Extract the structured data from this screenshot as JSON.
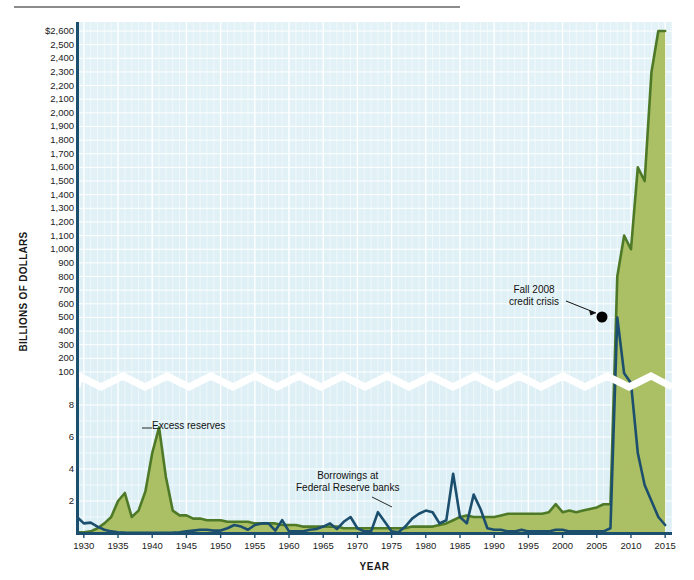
{
  "figure": {
    "y_axis_title": "BILLIONS OF DOLLARS",
    "x_axis_title": "YEAR"
  },
  "annotations": {
    "excess": "Excess reserves",
    "borrow_line1": "Borrowings at",
    "borrow_line2": "Federal Reserve banks",
    "crisis_line1": "Fall 2008",
    "crisis_line2": "credit crisis"
  },
  "colors": {
    "plot_background": "#dff0f5",
    "gridline": "#ffffff",
    "axis": "#1c4f6e",
    "series_reserves_line": "#4e7a28",
    "series_reserves_fill": "#a8bc5c",
    "series_borrowings_line": "#1c4f6e",
    "marker": "#000000",
    "top_rule": "#8b8b8b"
  },
  "chart_data": {
    "type": "area",
    "title": "",
    "subtitle": "",
    "xlabel": "YEAR",
    "ylabel": "BILLIONS OF DOLLARS",
    "grid": true,
    "legend": "inline-annotations",
    "broken_axis": true,
    "axis_break_note": "Y-axis is broken: lower band 0-8 (ticks 2,4,6,8), upper band 100-2600 (ticks every 100).",
    "ylim_lower_band": [
      0,
      9
    ],
    "ylim_upper_band": [
      0,
      2600
    ],
    "ytick_labels_upper": [
      "$2,600",
      "2,500",
      "2,400",
      "2,300",
      "2,200",
      "2,100",
      "2,000",
      "1,900",
      "1,800",
      "1,700",
      "1,600",
      "1,500",
      "1,400",
      "1,300",
      "1,200",
      "1,100",
      "1,000",
      "900",
      "800",
      "700",
      "600",
      "500",
      "400",
      "300",
      "200",
      "100"
    ],
    "ytick_values_upper": [
      2600,
      2500,
      2400,
      2300,
      2200,
      2100,
      2000,
      1900,
      1800,
      1700,
      1600,
      1500,
      1400,
      1300,
      1200,
      1100,
      1000,
      900,
      800,
      700,
      600,
      500,
      400,
      300,
      200,
      100
    ],
    "ytick_labels_lower": [
      "8",
      "6",
      "4",
      "2"
    ],
    "ytick_values_lower": [
      8,
      6,
      4,
      2
    ],
    "xlim": [
      1929,
      2016
    ],
    "xtick_labels": [
      "1930",
      "1935",
      "1940",
      "1945",
      "1950",
      "1955",
      "1960",
      "1965",
      "1970",
      "1975",
      "1980",
      "1985",
      "1990",
      "1995",
      "2000",
      "2005",
      "2010",
      "2015"
    ],
    "xtick_values": [
      1930,
      1935,
      1940,
      1945,
      1950,
      1955,
      1960,
      1965,
      1970,
      1975,
      1980,
      1985,
      1990,
      1995,
      2000,
      2005,
      2010,
      2015
    ],
    "series": [
      {
        "name": "Excess reserves",
        "style": "area",
        "line_color": "#4e7a28",
        "fill_color": "#a8bc5c",
        "x": [
          1929,
          1930,
          1931,
          1932,
          1933,
          1934,
          1935,
          1936,
          1937,
          1938,
          1939,
          1940,
          1941,
          1942,
          1943,
          1944,
          1945,
          1946,
          1947,
          1948,
          1949,
          1950,
          1951,
          1952,
          1953,
          1954,
          1955,
          1956,
          1957,
          1958,
          1959,
          1960,
          1961,
          1962,
          1963,
          1964,
          1965,
          1966,
          1967,
          1968,
          1969,
          1970,
          1971,
          1972,
          1973,
          1974,
          1975,
          1976,
          1977,
          1978,
          1979,
          1980,
          1981,
          1982,
          1983,
          1984,
          1985,
          1986,
          1987,
          1988,
          1989,
          1990,
          1991,
          1992,
          1993,
          1994,
          1995,
          1996,
          1997,
          1998,
          1999,
          2000,
          2001,
          2002,
          2003,
          2004,
          2005,
          2006,
          2007,
          2008,
          2009,
          2010,
          2011,
          2012,
          2013,
          2014,
          2015
        ],
        "y": [
          0.05,
          0.05,
          0.1,
          0.3,
          0.6,
          1.0,
          2.0,
          2.5,
          1.0,
          1.4,
          2.6,
          5.0,
          6.6,
          3.5,
          1.4,
          1.1,
          1.1,
          0.9,
          0.9,
          0.8,
          0.8,
          0.8,
          0.7,
          0.7,
          0.7,
          0.7,
          0.6,
          0.6,
          0.6,
          0.6,
          0.5,
          0.5,
          0.5,
          0.4,
          0.4,
          0.4,
          0.4,
          0.4,
          0.4,
          0.3,
          0.3,
          0.3,
          0.3,
          0.3,
          0.3,
          0.3,
          0.3,
          0.3,
          0.3,
          0.4,
          0.4,
          0.4,
          0.4,
          0.5,
          0.6,
          0.8,
          1.0,
          1.1,
          1.0,
          1.0,
          1.0,
          1.0,
          1.1,
          1.2,
          1.2,
          1.2,
          1.2,
          1.2,
          1.2,
          1.3,
          1.8,
          1.3,
          1.4,
          1.3,
          1.4,
          1.5,
          1.6,
          1.8,
          1.8,
          800,
          1100,
          1000,
          1600,
          1500,
          2300,
          2600,
          2600
        ],
        "y_units": "billions of dollars",
        "note": "Pre-2008 values are in the lower (0-8 billion) band; from late 2008 onward the series jumps into the upper (100-2600 billion) band."
      },
      {
        "name": "Borrowings at Federal Reserve banks",
        "style": "line",
        "line_color": "#1c4f6e",
        "x": [
          1929,
          1930,
          1931,
          1932,
          1933,
          1934,
          1935,
          1936,
          1937,
          1938,
          1939,
          1940,
          1941,
          1942,
          1943,
          1944,
          1945,
          1946,
          1947,
          1948,
          1949,
          1950,
          1951,
          1952,
          1953,
          1954,
          1955,
          1956,
          1957,
          1958,
          1959,
          1960,
          1961,
          1962,
          1963,
          1964,
          1965,
          1966,
          1967,
          1968,
          1969,
          1970,
          1971,
          1972,
          1973,
          1974,
          1975,
          1976,
          1977,
          1978,
          1979,
          1980,
          1981,
          1982,
          1983,
          1984,
          1985,
          1986,
          1987,
          1988,
          1989,
          1990,
          1991,
          1992,
          1993,
          1994,
          1995,
          1996,
          1997,
          1998,
          1999,
          2000,
          2001,
          2002,
          2003,
          2004,
          2005,
          2006,
          2007,
          2008,
          2009,
          2010,
          2011,
          2012,
          2013,
          2014,
          2015
        ],
        "y": [
          1.0,
          0.6,
          0.65,
          0.4,
          0.2,
          0.1,
          0.05,
          0.03,
          0.02,
          0.02,
          0.01,
          0.01,
          0.01,
          0.02,
          0.03,
          0.05,
          0.1,
          0.15,
          0.2,
          0.2,
          0.15,
          0.15,
          0.3,
          0.5,
          0.4,
          0.2,
          0.5,
          0.6,
          0.6,
          0.15,
          0.8,
          0.1,
          0.1,
          0.1,
          0.2,
          0.25,
          0.4,
          0.6,
          0.25,
          0.7,
          1.0,
          0.3,
          0.1,
          0.1,
          1.3,
          0.7,
          0.1,
          0.05,
          0.4,
          0.9,
          1.2,
          1.4,
          1.3,
          0.6,
          0.8,
          3.7,
          1.0,
          0.6,
          2.4,
          1.5,
          0.3,
          0.2,
          0.2,
          0.1,
          0.1,
          0.2,
          0.1,
          0.1,
          0.1,
          0.1,
          0.2,
          0.2,
          0.1,
          0.1,
          0.1,
          0.1,
          0.1,
          0.1,
          0.3,
          500,
          90,
          20,
          5,
          3,
          2,
          1,
          0.5
        ],
        "y_units": "billions of dollars",
        "note": "Spikes to about $500 billion in fall 2008 (marked point), then falls back. All other values are in the lower (0-8 billion) band."
      }
    ],
    "point_annotations": [
      {
        "label": "Fall 2008 credit crisis",
        "x": 2008,
        "y": 500,
        "marker": "filled-circle",
        "marker_color": "#000000"
      }
    ],
    "series_annotations": [
      {
        "label": "Excess reserves",
        "series": "Excess reserves"
      },
      {
        "label": "Borrowings at Federal Reserve banks",
        "series": "Borrowings at Federal Reserve banks"
      }
    ]
  }
}
